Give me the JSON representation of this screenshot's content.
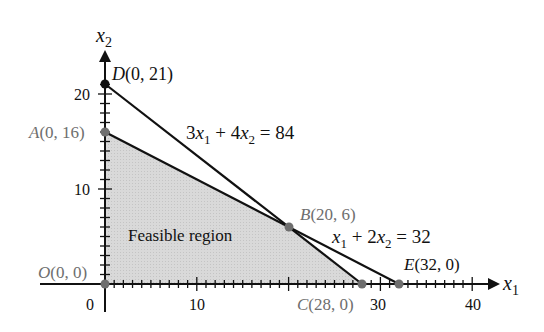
{
  "chart_data": {
    "type": "line",
    "title": "",
    "xlabel": "x1",
    "ylabel": "x2",
    "xlim": [
      0,
      42
    ],
    "ylim": [
      0,
      23
    ],
    "x_ticks": [
      0,
      10,
      30,
      40
    ],
    "x_tick_labels": [
      "0",
      "10",
      "30",
      "40"
    ],
    "y_ticks": [
      10,
      20
    ],
    "y_tick_labels": [
      "10",
      "20"
    ],
    "grid": false,
    "legend": null,
    "series": [
      {
        "name": "3x1 + 4x2 = 84",
        "points": [
          [
            0,
            21
          ],
          [
            28,
            0
          ]
        ],
        "label": "3x1 + 4x2 = 84"
      },
      {
        "name": "x1 + 2x2 = 32",
        "points": [
          [
            0,
            16
          ],
          [
            32,
            0
          ]
        ],
        "label": "x1 + 2x2 = 32"
      }
    ],
    "feasible_region": {
      "label": "Feasible region",
      "vertices": [
        [
          0,
          0
        ],
        [
          0,
          16
        ],
        [
          20,
          6
        ],
        [
          28,
          0
        ]
      ]
    },
    "points": [
      {
        "name": "O",
        "x": 0,
        "y": 0,
        "label": "O(0, 0)"
      },
      {
        "name": "A",
        "x": 0,
        "y": 16,
        "label": "A(0, 16)"
      },
      {
        "name": "B",
        "x": 20,
        "y": 6,
        "label": "B(20, 6)"
      },
      {
        "name": "C",
        "x": 28,
        "y": 0,
        "label": "C(28, 0)"
      },
      {
        "name": "D",
        "x": 0,
        "y": 21,
        "label": "D(0, 21)"
      },
      {
        "name": "E",
        "x": 32,
        "y": 0,
        "label": "E(32, 0)"
      }
    ]
  },
  "labels": {
    "x_axis": "x",
    "x_axis_sub": "1",
    "y_axis": "x",
    "y_axis_sub": "2",
    "feasible": "Feasible region",
    "eq1": {
      "a": "3x",
      "a_sub": "1",
      "b": " + 4x",
      "b_sub": "2",
      "c": " = 84"
    },
    "eq2": {
      "a": "x",
      "a_sub": "1",
      "b": " + 2x",
      "b_sub": "2",
      "c": " = 32"
    },
    "pt_O": "O(0, 0)",
    "pt_A": "A(0, 16)",
    "pt_B": "B(20, 6)",
    "pt_C": "C(28, 0)",
    "pt_D": "D(0, 21)",
    "pt_E": "E(32, 0)",
    "tick_0": "0",
    "tick_x10": "10",
    "tick_x30": "30",
    "tick_x40": "40",
    "tick_y10": "10",
    "tick_y20": "20"
  },
  "colors": {
    "line": "#111111",
    "feasible_fill": "#d6d6d6",
    "point": "#6e6e6e",
    "point_label": "#6e6e6e",
    "text": "#111111"
  }
}
